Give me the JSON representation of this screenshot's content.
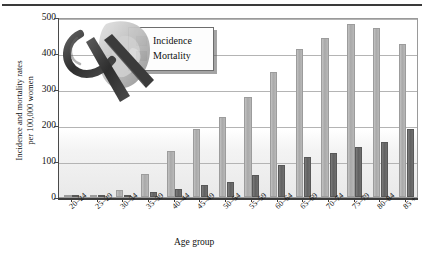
{
  "chart_data": {
    "type": "bar",
    "title": "",
    "xlabel": "Age group",
    "ylabel": "Incidence and mortality rates per 100,000 women",
    "ylim": [
      0,
      500
    ],
    "yticks": [
      0,
      100,
      200,
      300,
      400,
      500
    ],
    "grid": true,
    "legend_position": "top-left-inside",
    "categories": [
      "20–24",
      "25–29",
      "30–34",
      "35–39",
      "40–44",
      "45–49",
      "50–54",
      "55–59",
      "60–64",
      "65–69",
      "70–74",
      "75–79",
      "80–84",
      "85 +"
    ],
    "series": [
      {
        "name": "Incidence",
        "color": "#b0b0b0",
        "values": [
          1,
          3,
          20,
          63,
          128,
          190,
          222,
          277,
          347,
          410,
          443,
          480,
          470,
          425
        ]
      },
      {
        "name": "Mortality",
        "color": "#666666",
        "values": [
          0,
          1,
          4,
          13,
          22,
          33,
          43,
          62,
          88,
          110,
          122,
          138,
          152,
          188
        ]
      }
    ]
  },
  "axes": {
    "y_title_line1": "Incidence and mortality rates",
    "y_title_line2": "per 100,000 women",
    "x_title": "Age group",
    "y_tick_labels": [
      "500",
      "400",
      "300",
      "200",
      "100",
      "0"
    ]
  },
  "legend": {
    "items": [
      {
        "label": "Incidence",
        "color": "#b5b5b5"
      },
      {
        "label": "Mortality",
        "color": "#666666"
      }
    ]
  },
  "artwork": {
    "name": "awareness-ribbon-over-woman-profile"
  }
}
